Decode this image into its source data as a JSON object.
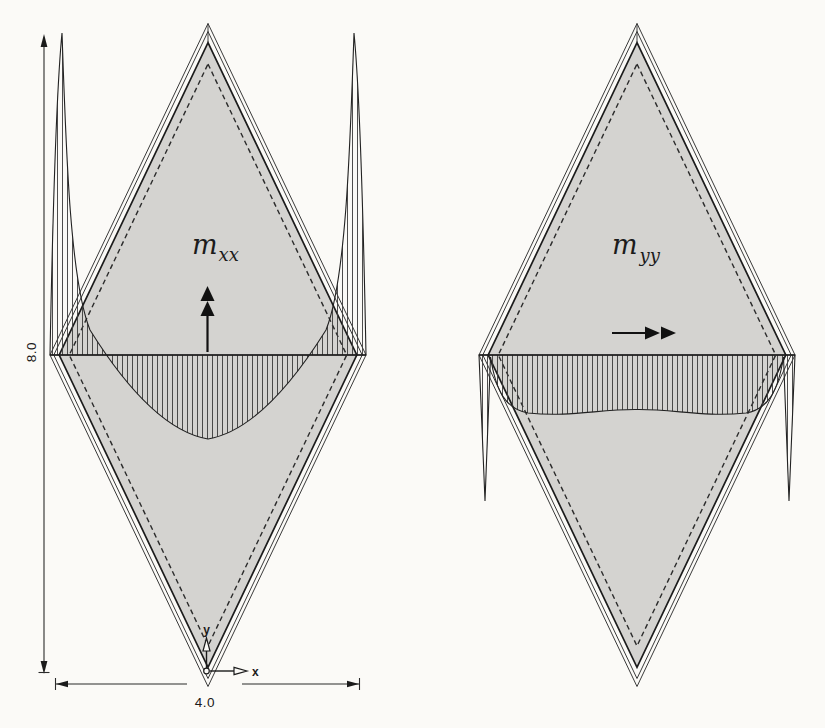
{
  "figure": {
    "left_diagram": {
      "label_base": "m",
      "label_sub": "xx",
      "arrow_direction": "up"
    },
    "right_diagram": {
      "label_base": "m",
      "label_sub": "yy",
      "arrow_direction": "right"
    },
    "dimensions": {
      "height": "8.0",
      "width": "4.0"
    },
    "axes": {
      "x": "x",
      "y": "y"
    },
    "colors": {
      "plate_fill": "#d4d3d0",
      "ink": "#1c1c1c",
      "background": "#fbfaf7"
    }
  }
}
